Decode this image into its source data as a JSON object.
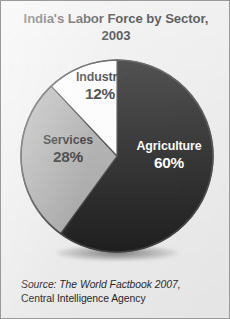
{
  "figure": {
    "background_color": "#ececed",
    "border_color": "#9a9a9a"
  },
  "title": {
    "line1": "India's Labor Force by Sector,",
    "line2": "2003"
  },
  "source": {
    "line1": "Source: The World Factbook 2007,",
    "line2": "Central Intelligence Agency"
  },
  "chart_data": {
    "type": "pie",
    "title": "India's Labor Force by Sector, 2003",
    "xlabel": "",
    "ylabel": "",
    "units": "percent",
    "start_angle_deg": 0,
    "direction": "clockwise",
    "grid": false,
    "legend": "none (labels drawn inside slices)",
    "categories": [
      "Agriculture",
      "Services",
      "Industry"
    ],
    "values": [
      60,
      28,
      12
    ],
    "slices": [
      {
        "label": "Agriculture",
        "value": 60,
        "value_label": "60%",
        "color": "#0d0d0d",
        "text_color": "#ffffff",
        "start_deg": 0,
        "end_deg": 216
      },
      {
        "label": "Services",
        "value": 28,
        "value_label": "28%",
        "color": "#a2a2a2",
        "text_color": "#121212",
        "start_deg": 216,
        "end_deg": 316.8
      },
      {
        "label": "Industry",
        "value": 12,
        "value_label": "12%",
        "color": "#fdfdfd",
        "text_color": "#121212",
        "start_deg": 316.8,
        "end_deg": 360
      }
    ],
    "outline_color": "#2e2e2e"
  }
}
